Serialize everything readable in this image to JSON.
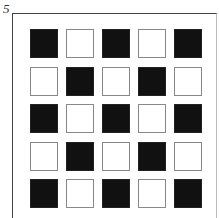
{
  "figure": {
    "label": "5",
    "rows": 5,
    "cols": 5,
    "colors": {
      "filled": "#111111",
      "empty": "#ffffff",
      "outline": "#888888"
    },
    "grid": [
      [
        "black",
        "white",
        "black",
        "white",
        "black"
      ],
      [
        "white",
        "black",
        "white",
        "black",
        "white"
      ],
      [
        "black",
        "white",
        "black",
        "white",
        "black"
      ],
      [
        "white",
        "black",
        "white",
        "black",
        "white"
      ],
      [
        "black",
        "white",
        "black",
        "white",
        "black"
      ]
    ]
  }
}
